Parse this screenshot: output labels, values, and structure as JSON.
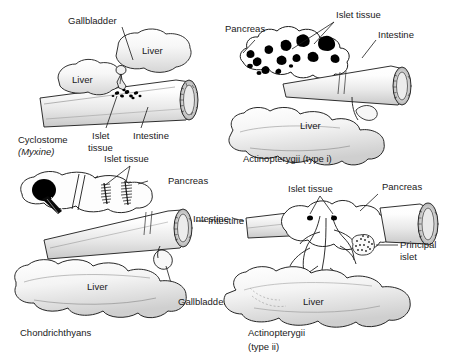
{
  "figure": {
    "background_color": "#ffffff",
    "ink_color": "#1a1a1a",
    "width": 459,
    "height": 362
  },
  "panels": [
    {
      "id": "cyclostome",
      "caption_line1": "Cyclostome",
      "caption_line2": "(Myxine)",
      "caption_line2_italic": true,
      "labels": [
        {
          "name": "gallbladder",
          "text": "Gallbladder"
        },
        {
          "name": "liver-left",
          "text": "Liver"
        },
        {
          "name": "liver-right",
          "text": "Liver"
        },
        {
          "name": "islet-tissue",
          "text": "Islet\ntissue",
          "line1": "Islet",
          "line2": "tissue"
        },
        {
          "name": "intestine",
          "text": "Intestine"
        }
      ]
    },
    {
      "id": "actinopterygii-type-i",
      "caption_line1": "Actinopterygii (type i)",
      "caption_line2": "",
      "caption_line2_italic": false,
      "labels": [
        {
          "name": "pancreas",
          "text": "Pancreas"
        },
        {
          "name": "islet-tissue",
          "text": "Islet tissue"
        },
        {
          "name": "intestine",
          "text": "Intestine"
        },
        {
          "name": "liver",
          "text": "Liver"
        }
      ]
    },
    {
      "id": "chondrichthyans",
      "caption_line1": "Chondrichthyans",
      "caption_line2": "",
      "caption_line2_italic": false,
      "labels": [
        {
          "name": "islet-tissue",
          "text": "Islet tissue"
        },
        {
          "name": "pancreas",
          "text": "Pancreas"
        },
        {
          "name": "intestine",
          "text": "Intestine"
        },
        {
          "name": "liver",
          "text": "Liver"
        },
        {
          "name": "gallbladder",
          "text": "Gallbladder"
        }
      ]
    },
    {
      "id": "actinopterygii-type-ii",
      "caption_line1": "Actinopterygii",
      "caption_line2": "(type ii)",
      "caption_line2_italic": false,
      "labels": [
        {
          "name": "islet-tissue",
          "text": "Islet tissue"
        },
        {
          "name": "pancreas",
          "text": "Pancreas"
        },
        {
          "name": "intestine",
          "text": "Intestine"
        },
        {
          "name": "principal-islet",
          "line1": "Principal",
          "line2": "islet"
        },
        {
          "name": "liver",
          "text": "Liver"
        }
      ]
    }
  ],
  "text": {
    "gallbladder": "Gallbladder",
    "liver": "Liver",
    "islet_tissue": "Islet tissue",
    "islet": "Islet",
    "tissue": "tissue",
    "intestine": "Intestine",
    "pancreas": "Pancreas",
    "principal": "Principal",
    "islet_word": "islet",
    "cyclostome": "Cyclostome",
    "myxine": "(Myxine)",
    "actino_i": "Actinopterygii (type i)",
    "actino_ii": "Actinopterygii",
    "type_ii": "(type ii)",
    "chondrichthyans": "Chondrichthyans"
  }
}
